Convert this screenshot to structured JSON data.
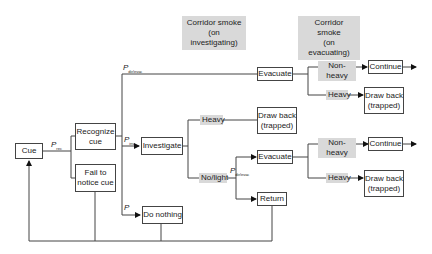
{
  "headers": {
    "investigating": "Corridor smoke\n(on investigating)",
    "investigating_l1": "Corridor smoke",
    "investigating_l2": "(on investigating)",
    "evacuating_l1": "Corridor smoke",
    "evacuating_l2": "(on evacuating)"
  },
  "nodes": {
    "cue": "Cue",
    "recognize_l1": "Recognize",
    "recognize_l2": "cue",
    "fail_l1": "Fail to",
    "fail_l2": "notice cue",
    "investigate": "Investigate",
    "do_nothing": "Do nothing",
    "evacuate_top": "Evacuate",
    "continue_top": "Continue",
    "drawback_top_l1": "Draw back",
    "drawback_top_l2": "(trapped)",
    "drawback_mid_l1": "Draw back",
    "drawback_mid_l2": "(trapped)",
    "evacuate_low": "Evacuate",
    "return": "Return",
    "continue_low": "Continue",
    "drawback_low_l1": "Draw back",
    "drawback_low_l2": "(trapped)"
  },
  "conditions": {
    "nonheavy_top": "Non-heavy",
    "heavy_top": "Heavy",
    "heavy_mid": "Heavy",
    "nolight": "No/light",
    "nonheavy_low": "Non-heavy",
    "heavy_low": "Heavy"
  },
  "probabilities": {
    "p": "P",
    "rec": "rec",
    "inv": "inv",
    "dirievac": "dir/evac",
    "dirievac_low": "dir/evac"
  }
}
